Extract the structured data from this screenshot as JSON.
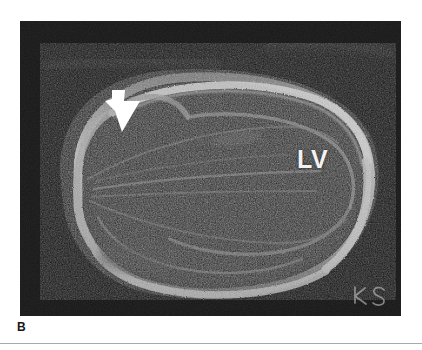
{
  "figure": {
    "panel_letter": "B",
    "panel_letter_color": "#171717",
    "background_color": "#ffffff",
    "rule_color": "#a9a9a9"
  },
  "micrograph": {
    "name": "dark-field brain section micrograph",
    "background_color": "#151515",
    "signal_color": "#d6d6d6",
    "mid_tone_color": "#6e6e6e",
    "panel": {
      "x": 20,
      "y": 21,
      "width": 381,
      "height": 295
    }
  },
  "annotations": {
    "ventricle_label": {
      "text": "LV",
      "color": "#f2f2f2",
      "x": 277,
      "y": 126
    },
    "arrow": {
      "icon": "arrow-down-right-solid",
      "color": "#ffffff",
      "x": 82,
      "y": 66
    },
    "signature": {
      "text": "KS",
      "color": "#cfcfcf",
      "x": 330,
      "y": 262
    }
  }
}
